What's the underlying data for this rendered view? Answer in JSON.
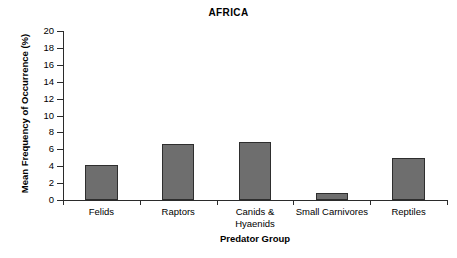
{
  "chart_data": {
    "type": "bar",
    "title": "AFRICA",
    "xlabel": "Predator Group",
    "ylabel": "Mean Frequency of Occurrence (%)",
    "categories": [
      "Felids",
      "Raptors",
      "Canids &\nHyaenids",
      "Small Carnivores",
      "Reptiles"
    ],
    "values": [
      4.1,
      6.6,
      6.9,
      0.8,
      5.0
    ],
    "ylim": [
      0,
      20
    ],
    "ytick_values": [
      0,
      2,
      4,
      6,
      8,
      10,
      12,
      14,
      16,
      18,
      20
    ],
    "ytick_labels": [
      "0",
      "2",
      "4",
      "6",
      "8",
      "10",
      "12",
      "14",
      "16",
      "18",
      "20"
    ],
    "grid": false,
    "legend": "none",
    "bar_color": "#6e6e6e",
    "bar_edge_color": "#2e2e2e",
    "axis_color": "#2b2b2b",
    "background": "#ffffff"
  }
}
